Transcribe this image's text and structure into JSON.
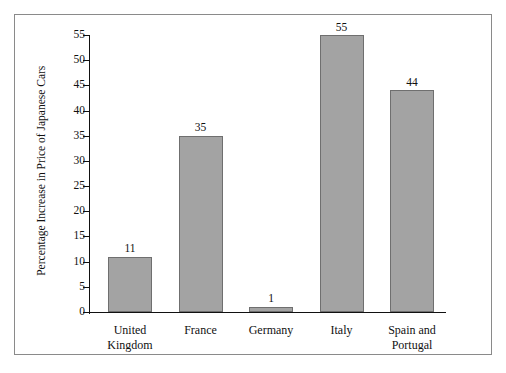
{
  "chart_data": {
    "type": "bar",
    "title": "",
    "xlabel": "",
    "ylabel": "Percentage Increase in Price of Japanese Cars",
    "categories": [
      "United Kingdom",
      "France",
      "Germany",
      "Italy",
      "Spain and Portugal"
    ],
    "category_lines": [
      [
        "United",
        "Kingdom"
      ],
      [
        "France"
      ],
      [
        "Germany"
      ],
      [
        "Italy"
      ],
      [
        "Spain and",
        "Portugal"
      ]
    ],
    "values": [
      11,
      35,
      1,
      55,
      44
    ],
    "value_labels": [
      "11",
      "35",
      "1",
      "55",
      "44"
    ],
    "ylim": [
      0,
      55
    ],
    "yticks": [
      0,
      5,
      10,
      15,
      20,
      25,
      30,
      35,
      40,
      45,
      50,
      55
    ],
    "ytick_labels": [
      "0",
      "5",
      "10",
      "15",
      "20",
      "25",
      "30",
      "35",
      "40",
      "45",
      "50",
      "55"
    ],
    "grid": false,
    "legend": null,
    "colors": {
      "bar_fill": "#a3a3a3",
      "bar_edge": "#6f6f6f",
      "axis": "#111111",
      "frame": "#8a8a8a",
      "background": "#ffffff",
      "text": "#111111"
    }
  }
}
